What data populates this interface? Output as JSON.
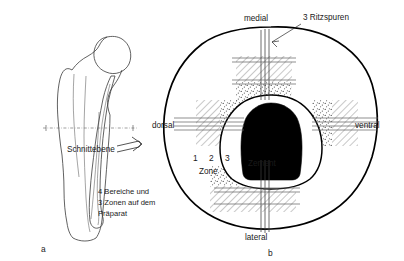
{
  "figure": {
    "panel_a": {
      "id": "a",
      "caption_cut_plane": "Schnittebene",
      "note_lines": [
        "4 Bereiche und",
        "3 Zonen auf dem",
        "Präparat"
      ],
      "icon_cut_arrow": "double-line-arrow-right"
    },
    "panel_b": {
      "id": "b",
      "orientation_labels": {
        "top": "medial",
        "bottom": "lateral",
        "left": "dorsal",
        "right": "ventral"
      },
      "annotation_scratches": "3 Ritzspuren",
      "center_label": "Zement",
      "zone_numbers": [
        "1",
        "2",
        "3"
      ],
      "zone_caption": "Zone"
    }
  },
  "colors": {
    "ink": "#000000",
    "cement_fill": "#000000",
    "bone_outline": "#3a3a3a",
    "hatch": "#6e6e6e",
    "background": "#ffffff"
  }
}
